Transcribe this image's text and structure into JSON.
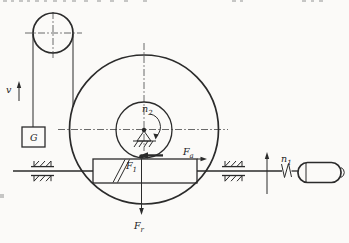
{
  "figure": {
    "description_colors": {
      "background": "#fbfaf8",
      "ink": "#2b2b2b"
    },
    "labels": {
      "velocity": "v",
      "weight": "G",
      "wheel_speed": {
        "base": "n",
        "sub": "2"
      },
      "worm_speed": {
        "base": "n",
        "sub": "1"
      },
      "force_tangential": {
        "base": "F",
        "sub": "1"
      },
      "force_axial": {
        "base": "F",
        "sub": "a"
      },
      "force_radial": {
        "base": "F",
        "sub": "r"
      }
    }
  }
}
